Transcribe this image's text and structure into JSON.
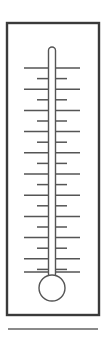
{
  "figure": {
    "background_color": "#ffffff"
  },
  "frame": {
    "name": "outer-frame",
    "x": 7,
    "y": 23,
    "width": 92,
    "height": 292,
    "stroke_color": "#3a3a3a",
    "stroke_width": 2.4,
    "fill_color": "#ffffff"
  },
  "thermometer": {
    "tube": {
      "center_x": 52,
      "top_y": 47,
      "bottom_y": 278,
      "width": 7,
      "corner_radius": 3.5,
      "stroke_color": "#555555",
      "stroke_width": 1.4,
      "fill_color": "#ffffff"
    },
    "bulb": {
      "center_x": 52,
      "center_y": 288,
      "radius": 13,
      "stroke_color": "#555555",
      "stroke_width": 1.4,
      "fill_color": "#ffffff"
    },
    "mercury_level": null,
    "scale": {
      "long_tick": {
        "x_start": 24,
        "x_end": 80,
        "length": 56,
        "stroke_color": "#555555",
        "stroke_width": 1.5,
        "count": 11
      },
      "short_tick": {
        "x_start": 37,
        "x_end": 67,
        "length": 30,
        "stroke_color": "#555555",
        "stroke_width": 1.5,
        "count": 10
      },
      "first_tick_y": 68,
      "tick_spacing": 10.6,
      "total_ticks": 21,
      "pattern": "long-short-alternating",
      "ticks": [
        {
          "y": 68.0,
          "type": "long"
        },
        {
          "y": 78.6,
          "type": "short"
        },
        {
          "y": 89.2,
          "type": "long"
        },
        {
          "y": 99.8,
          "type": "short"
        },
        {
          "y": 110.4,
          "type": "long"
        },
        {
          "y": 121.0,
          "type": "short"
        },
        {
          "y": 131.6,
          "type": "long"
        },
        {
          "y": 142.2,
          "type": "short"
        },
        {
          "y": 152.8,
          "type": "long"
        },
        {
          "y": 163.4,
          "type": "short"
        },
        {
          "y": 174.0,
          "type": "long"
        },
        {
          "y": 184.6,
          "type": "short"
        },
        {
          "y": 195.2,
          "type": "long"
        },
        {
          "y": 205.8,
          "type": "short"
        },
        {
          "y": 216.4,
          "type": "long"
        },
        {
          "y": 227.0,
          "type": "short"
        },
        {
          "y": 237.6,
          "type": "long"
        },
        {
          "y": 248.2,
          "type": "short"
        },
        {
          "y": 258.8,
          "type": "long"
        },
        {
          "y": 269.4,
          "type": "short"
        },
        {
          "y": 272.0,
          "type": "long"
        }
      ]
    }
  },
  "footer_rule": {
    "name": "footer-divider",
    "x_start": 8,
    "x_end": 98,
    "y": 329,
    "stroke_color": "#8a8a8a",
    "stroke_width": 2
  }
}
